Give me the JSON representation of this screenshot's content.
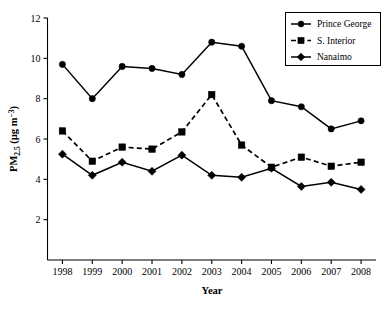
{
  "chart_data": {
    "type": "line",
    "title": "",
    "xlabel": "Year",
    "ylabel": "PM2.5 (µg m−3)",
    "ylabel_parts": {
      "base": "PM",
      "sub": "2.5",
      "unit_open": " (µg m",
      "sup": "−3",
      "unit_close": ")"
    },
    "x": [
      1998,
      1999,
      2000,
      2001,
      2002,
      2003,
      2004,
      2005,
      2006,
      2007,
      2008
    ],
    "xticklabels": [
      "1998",
      "1999",
      "2000",
      "2001",
      "2002",
      "2003",
      "2004",
      "2005",
      "2006",
      "2007",
      "2008"
    ],
    "yticks": [
      2,
      4,
      6,
      8,
      10,
      12
    ],
    "yticklabels": [
      "2",
      "4",
      "6",
      "8",
      "10",
      "12"
    ],
    "xlim": [
      1997.5,
      2008.5
    ],
    "ylim": [
      0,
      12
    ],
    "grid": false,
    "legend_position": "top-right",
    "series": [
      {
        "name": "Prince George",
        "marker": "circle",
        "linestyle": "solid",
        "color": "#000000",
        "values": [
          9.7,
          8.0,
          9.6,
          9.5,
          9.2,
          10.8,
          10.6,
          7.9,
          7.6,
          6.5,
          6.9
        ]
      },
      {
        "name": "S. Interior",
        "marker": "square",
        "linestyle": "dashed",
        "color": "#000000",
        "values": [
          6.4,
          4.9,
          5.6,
          5.5,
          6.35,
          8.2,
          5.7,
          4.6,
          5.1,
          4.65,
          4.85
        ]
      },
      {
        "name": "Nanaimo",
        "marker": "diamond",
        "linestyle": "solid",
        "color": "#000000",
        "values": [
          5.25,
          4.2,
          4.85,
          4.4,
          5.2,
          4.2,
          4.1,
          4.55,
          3.65,
          3.85,
          3.5
        ]
      }
    ]
  },
  "legend": {
    "entries": [
      {
        "label": "Prince George",
        "marker": "circle",
        "linestyle": "solid"
      },
      {
        "label": "S. Interior",
        "marker": "square",
        "linestyle": "dashed"
      },
      {
        "label": "Nanaimo",
        "marker": "diamond",
        "linestyle": "solid"
      }
    ]
  }
}
